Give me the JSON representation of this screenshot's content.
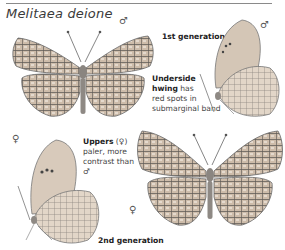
{
  "page": {
    "title": "Melitaea deione",
    "colors": {
      "wing_base": "#c9b8a6",
      "wing_vein": "#5a5652",
      "wing_light": "#e3d8cc",
      "body": "#8a8580",
      "rule": "#8a8a8a"
    }
  },
  "figures": [
    {
      "id": "male-upperside",
      "sex_symbol": "♂",
      "view": "upperside"
    },
    {
      "id": "male-underside",
      "sex_symbol": "♂",
      "view": "underside"
    },
    {
      "id": "female-underside",
      "sex_symbol": "♀",
      "view": "underside"
    },
    {
      "id": "female-upperside",
      "sex_symbol": "♀",
      "view": "upperside"
    }
  ],
  "labels": {
    "gen1": "1st generation",
    "gen2": "2nd generation",
    "underside_bold": "Underside hwing",
    "underside_line1_bold": "Underside",
    "underside_line2_bold": "hwing",
    "underside_line2_rest": " has",
    "underside_line3": "red spots in",
    "underside_line4": "submarginal band",
    "uppers_bold": "Uppers",
    "uppers_sym": " (♀)",
    "uppers_line2": "paler, more",
    "uppers_line3": "contrast than",
    "uppers_line4": "♂"
  }
}
